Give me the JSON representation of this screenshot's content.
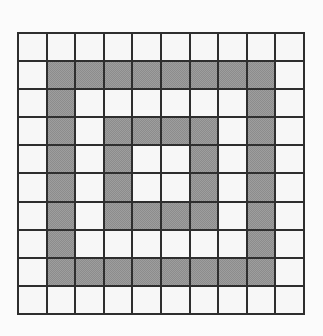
{
  "figure": {
    "kind": "pixel-grid",
    "rows": 10,
    "columns": 10,
    "colors": {
      "background": "#fbfbfb",
      "grid_line": "#2e2e2e",
      "cell_empty": "#f7f7f7",
      "cell_filled": "#8c8c8c"
    },
    "legend": {
      "empty_label": "empty",
      "filled_label": "filled"
    }
  },
  "grid": {
    "cells": [
      [
        0,
        0,
        0,
        0,
        0,
        0,
        0,
        0,
        0,
        0
      ],
      [
        0,
        1,
        1,
        1,
        1,
        1,
        1,
        1,
        1,
        0
      ],
      [
        0,
        1,
        0,
        0,
        0,
        0,
        0,
        0,
        1,
        0
      ],
      [
        0,
        1,
        0,
        1,
        1,
        1,
        1,
        0,
        1,
        0
      ],
      [
        0,
        1,
        0,
        1,
        0,
        0,
        1,
        0,
        1,
        0
      ],
      [
        0,
        1,
        0,
        1,
        0,
        0,
        1,
        0,
        1,
        0
      ],
      [
        0,
        1,
        0,
        1,
        1,
        1,
        1,
        0,
        1,
        0
      ],
      [
        0,
        1,
        0,
        0,
        0,
        0,
        0,
        0,
        1,
        0
      ],
      [
        0,
        1,
        1,
        1,
        1,
        1,
        1,
        1,
        1,
        0
      ],
      [
        0,
        0,
        0,
        0,
        0,
        0,
        0,
        0,
        0,
        0
      ]
    ],
    "filled_count": 36,
    "empty_count": 64
  }
}
